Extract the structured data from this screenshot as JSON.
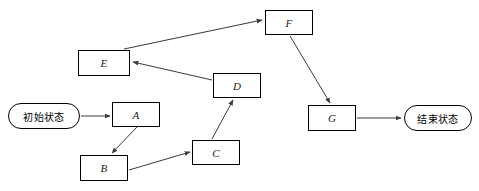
{
  "diagram": {
    "background": "#ffffff",
    "stroke": "#000000",
    "edge_stroke": "#3a3a3a",
    "width": 479,
    "height": 191,
    "nodes": [
      {
        "id": "start",
        "label": "初始状态",
        "shape": "stadium",
        "x": 8,
        "y": 103,
        "w": 72,
        "h": 26
      },
      {
        "id": "A",
        "label": "A",
        "shape": "rect",
        "x": 112,
        "y": 102,
        "w": 48,
        "h": 25
      },
      {
        "id": "B",
        "label": "B",
        "shape": "rect",
        "x": 80,
        "y": 155,
        "w": 48,
        "h": 26
      },
      {
        "id": "C",
        "label": "C",
        "shape": "rect",
        "x": 192,
        "y": 140,
        "w": 48,
        "h": 25
      },
      {
        "id": "D",
        "label": "D",
        "shape": "rect",
        "x": 213,
        "y": 73,
        "w": 48,
        "h": 25
      },
      {
        "id": "E",
        "label": "E",
        "shape": "rect",
        "x": 78,
        "y": 50,
        "w": 52,
        "h": 26
      },
      {
        "id": "F",
        "label": "F",
        "shape": "rect",
        "x": 265,
        "y": 10,
        "w": 48,
        "h": 25
      },
      {
        "id": "G",
        "label": "G",
        "shape": "rect",
        "x": 308,
        "y": 105,
        "w": 48,
        "h": 26
      },
      {
        "id": "end",
        "label": "结束状态",
        "shape": "stadium",
        "x": 404,
        "y": 105,
        "w": 68,
        "h": 26
      }
    ],
    "edges": [
      {
        "from": "start",
        "to": "A",
        "x1": 81,
        "y1": 116,
        "x2": 110,
        "y2": 116
      },
      {
        "from": "A",
        "to": "B",
        "x1": 137,
        "y1": 127,
        "x2": 112,
        "y2": 153
      },
      {
        "from": "B",
        "to": "C",
        "x1": 129,
        "y1": 170,
        "x2": 190,
        "y2": 152
      },
      {
        "from": "C",
        "to": "D",
        "x1": 212,
        "y1": 139,
        "x2": 233,
        "y2": 100
      },
      {
        "from": "D",
        "to": "E",
        "x1": 212,
        "y1": 80,
        "x2": 133,
        "y2": 62
      },
      {
        "from": "E",
        "to": "F",
        "x1": 124,
        "y1": 49,
        "x2": 262,
        "y2": 20
      },
      {
        "from": "F",
        "to": "G",
        "x1": 290,
        "y1": 36,
        "x2": 330,
        "y2": 103
      },
      {
        "from": "G",
        "to": "end",
        "x1": 357,
        "y1": 118,
        "x2": 401,
        "y2": 118
      }
    ]
  }
}
